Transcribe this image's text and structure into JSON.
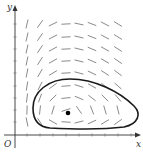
{
  "figure": {
    "type": "direction-field",
    "labels": {
      "x_axis": "x",
      "y_axis": "y",
      "origin": "O"
    },
    "colors": {
      "axis": "#333333",
      "curve": "#1a1a1a",
      "field": "#8a8a8a",
      "point": "#000000"
    },
    "equilibrium_point": {
      "px": 68,
      "py": 113
    },
    "closed_curve_label": "periodic solution trajectory"
  },
  "chart_data": {
    "type": "direction-field",
    "title": "",
    "xlabel": "x",
    "ylabel": "y",
    "origin_label": "O",
    "grid_columns_px": [
      27,
      40,
      53,
      66,
      79,
      92,
      105,
      118
    ],
    "grid_rows_px": [
      24,
      37,
      49,
      61,
      73,
      86,
      98,
      110,
      122
    ],
    "equilibrium": {
      "x_px": 68,
      "y_px": 113
    },
    "closed_curve": "counterclockwise-shaped loop around equilibrium, spanning roughly x 32–138 px, y 79–129 px"
  }
}
